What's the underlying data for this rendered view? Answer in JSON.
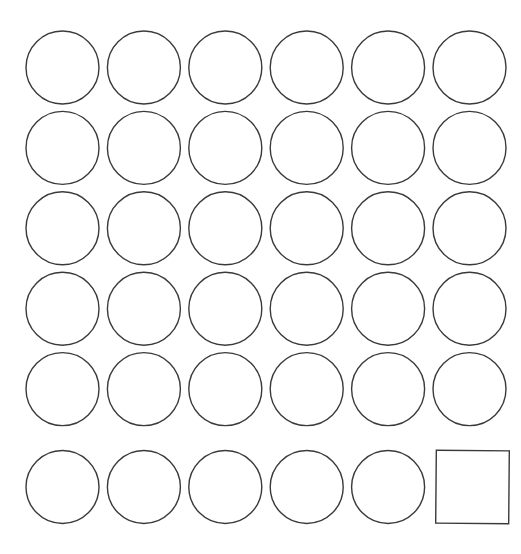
{
  "canvas": {
    "width": 521,
    "height": 554,
    "background_color": "#ffffff",
    "description": "Grid of outlined shapes"
  },
  "style": {
    "stroke_color": "#3a3a3a",
    "stroke_width": 1.4,
    "fill_color": "#ffffff"
  },
  "grid": {
    "rows": 6,
    "columns": 6,
    "total_shapes": 36,
    "circle_count": 35,
    "square_count": 1,
    "origin_x": 26,
    "origin_y": 31,
    "column_spacing": 81.4,
    "row_spacing": 80.4,
    "shape_size": 73
  },
  "shapes": [
    {
      "id": "shape-r1c1",
      "row": 1,
      "col": 1,
      "type": "circle",
      "cx": 62.5,
      "cy": 67.5,
      "r": 36.5
    },
    {
      "id": "shape-r1c2",
      "row": 1,
      "col": 2,
      "type": "circle",
      "cx": 143.9,
      "cy": 67.5,
      "r": 36.5
    },
    {
      "id": "shape-r1c3",
      "row": 1,
      "col": 3,
      "type": "circle",
      "cx": 225.3,
      "cy": 67.5,
      "r": 36.5
    },
    {
      "id": "shape-r1c4",
      "row": 1,
      "col": 4,
      "type": "circle",
      "cx": 306.7,
      "cy": 67.5,
      "r": 36.5
    },
    {
      "id": "shape-r1c5",
      "row": 1,
      "col": 5,
      "type": "circle",
      "cx": 388.1,
      "cy": 67.5,
      "r": 36.5
    },
    {
      "id": "shape-r1c6",
      "row": 1,
      "col": 6,
      "type": "circle",
      "cx": 469.5,
      "cy": 67.5,
      "r": 36.5
    },
    {
      "id": "shape-r2c1",
      "row": 2,
      "col": 1,
      "type": "circle",
      "cx": 62.5,
      "cy": 147.9,
      "r": 36.5
    },
    {
      "id": "shape-r2c2",
      "row": 2,
      "col": 2,
      "type": "circle",
      "cx": 143.9,
      "cy": 147.9,
      "r": 36.5
    },
    {
      "id": "shape-r2c3",
      "row": 2,
      "col": 3,
      "type": "circle",
      "cx": 225.3,
      "cy": 147.9,
      "r": 36.5
    },
    {
      "id": "shape-r2c4",
      "row": 2,
      "col": 4,
      "type": "circle",
      "cx": 306.7,
      "cy": 147.9,
      "r": 36.5
    },
    {
      "id": "shape-r2c5",
      "row": 2,
      "col": 5,
      "type": "circle",
      "cx": 388.1,
      "cy": 147.9,
      "r": 36.5
    },
    {
      "id": "shape-r2c6",
      "row": 2,
      "col": 6,
      "type": "circle",
      "cx": 469.5,
      "cy": 147.9,
      "r": 36.5
    },
    {
      "id": "shape-r3c1",
      "row": 3,
      "col": 1,
      "type": "circle",
      "cx": 62.5,
      "cy": 228.3,
      "r": 36.5
    },
    {
      "id": "shape-r3c2",
      "row": 3,
      "col": 2,
      "type": "circle",
      "cx": 143.9,
      "cy": 228.3,
      "r": 36.5
    },
    {
      "id": "shape-r3c3",
      "row": 3,
      "col": 3,
      "type": "circle",
      "cx": 225.3,
      "cy": 228.3,
      "r": 36.5
    },
    {
      "id": "shape-r3c4",
      "row": 3,
      "col": 4,
      "type": "circle",
      "cx": 306.7,
      "cy": 228.3,
      "r": 36.5
    },
    {
      "id": "shape-r3c5",
      "row": 3,
      "col": 5,
      "type": "circle",
      "cx": 388.1,
      "cy": 228.3,
      "r": 36.5
    },
    {
      "id": "shape-r3c6",
      "row": 3,
      "col": 6,
      "type": "circle",
      "cx": 469.5,
      "cy": 228.3,
      "r": 36.5
    },
    {
      "id": "shape-r4c1",
      "row": 4,
      "col": 1,
      "type": "circle",
      "cx": 62.5,
      "cy": 308.7,
      "r": 36.5
    },
    {
      "id": "shape-r4c2",
      "row": 4,
      "col": 2,
      "type": "circle",
      "cx": 143.9,
      "cy": 308.7,
      "r": 36.5
    },
    {
      "id": "shape-r4c3",
      "row": 4,
      "col": 3,
      "type": "circle",
      "cx": 225.3,
      "cy": 308.7,
      "r": 36.5
    },
    {
      "id": "shape-r4c4",
      "row": 4,
      "col": 4,
      "type": "circle",
      "cx": 306.7,
      "cy": 308.7,
      "r": 36.5
    },
    {
      "id": "shape-r4c5",
      "row": 4,
      "col": 5,
      "type": "circle",
      "cx": 388.1,
      "cy": 308.7,
      "r": 36.5
    },
    {
      "id": "shape-r4c6",
      "row": 4,
      "col": 6,
      "type": "circle",
      "cx": 469.5,
      "cy": 308.7,
      "r": 36.5
    },
    {
      "id": "shape-r5c1",
      "row": 5,
      "col": 1,
      "type": "circle",
      "cx": 62.5,
      "cy": 389.1,
      "r": 36.5
    },
    {
      "id": "shape-r5c2",
      "row": 5,
      "col": 2,
      "type": "circle",
      "cx": 143.9,
      "cy": 389.1,
      "r": 36.5
    },
    {
      "id": "shape-r5c3",
      "row": 5,
      "col": 3,
      "type": "circle",
      "cx": 225.3,
      "cy": 389.1,
      "r": 36.5
    },
    {
      "id": "shape-r5c4",
      "row": 5,
      "col": 4,
      "type": "circle",
      "cx": 306.7,
      "cy": 389.1,
      "r": 36.5
    },
    {
      "id": "shape-r5c5",
      "row": 5,
      "col": 5,
      "type": "circle",
      "cx": 388.1,
      "cy": 389.1,
      "r": 36.5
    },
    {
      "id": "shape-r5c6",
      "row": 5,
      "col": 6,
      "type": "circle",
      "cx": 469.5,
      "cy": 389.1,
      "r": 36.5
    },
    {
      "id": "shape-r6c1",
      "row": 6,
      "col": 1,
      "type": "circle",
      "cx": 62.5,
      "cy": 487.0,
      "r": 36.5
    },
    {
      "id": "shape-r6c2",
      "row": 6,
      "col": 2,
      "type": "circle",
      "cx": 143.9,
      "cy": 487.0,
      "r": 36.5
    },
    {
      "id": "shape-r6c3",
      "row": 6,
      "col": 3,
      "type": "circle",
      "cx": 225.3,
      "cy": 487.0,
      "r": 36.5
    },
    {
      "id": "shape-r6c4",
      "row": 6,
      "col": 4,
      "type": "circle",
      "cx": 306.7,
      "cy": 487.0,
      "r": 36.5
    },
    {
      "id": "shape-r6c5",
      "row": 6,
      "col": 5,
      "type": "circle",
      "cx": 388.1,
      "cy": 487.0,
      "r": 36.5
    },
    {
      "id": "shape-r6c6",
      "row": 6,
      "col": 6,
      "type": "square",
      "x": 436,
      "y": 450.5,
      "w": 73,
      "h": 73,
      "rotation": 0.5
    }
  ]
}
